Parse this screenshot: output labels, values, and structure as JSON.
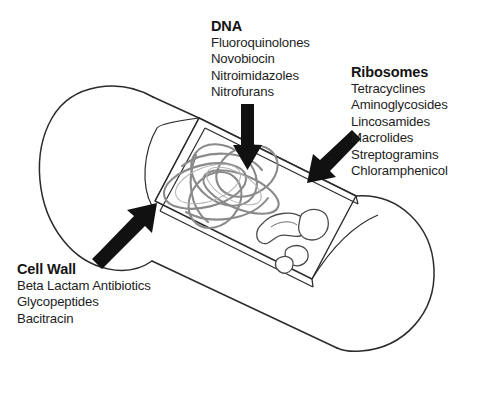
{
  "figure": {
    "alt_title": "Mechanisms and sites of action of antibacterial agents on a bacterial cell",
    "top_faint_text": "",
    "colors": {
      "background": "#ffffff",
      "outline": "#2b2b2b",
      "dna_strand": "#7a7a7a",
      "arrow": "#111111",
      "title_text": "#141414",
      "body_text": "#1d1d1d"
    },
    "cell_shape": "rod-shaped bacterium (bacillus) drawn in 3D perspective with a rectangular cutaway window revealing the interior",
    "interior_structures": [
      "tangled circular DNA nucleoid",
      "ribosome particles"
    ]
  },
  "labels": [
    {
      "id": "dna",
      "title": "DNA",
      "items": [
        "Fluoroquinolones",
        "Novobiocin",
        "Nitroimidazoles",
        "Nitrofurans"
      ],
      "arrow": "down-arrow-to-dna"
    },
    {
      "id": "ribosomes",
      "title": "Ribosomes",
      "items": [
        "Tetracyclines",
        "Aminoglycosides",
        "Lincosamides",
        "Macrolides",
        "Streptogramins",
        "Chloramphenicol"
      ],
      "arrow": "diagonal-arrow-to-ribosomes"
    },
    {
      "id": "cell_wall",
      "title": "Cell Wall",
      "items": [
        "Beta Lactam Antibiotics",
        "Glycopeptides",
        "Bacitracin"
      ],
      "arrow": "diagonal-arrow-to-cell-wall"
    }
  ]
}
